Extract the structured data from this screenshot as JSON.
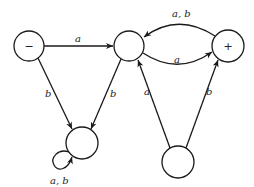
{
  "diagram": {
    "type": "finite-automaton",
    "nodes": [
      {
        "id": "start",
        "label": "−",
        "cx": 29,
        "cy": 46,
        "r": 15
      },
      {
        "id": "mid",
        "label": "",
        "cx": 129,
        "cy": 46,
        "r": 15
      },
      {
        "id": "final",
        "label": "+",
        "cx": 228,
        "cy": 46,
        "r": 16
      },
      {
        "id": "sink",
        "label": "",
        "cx": 82,
        "cy": 143,
        "r": 16
      },
      {
        "id": "bottom",
        "label": "",
        "cx": 178,
        "cy": 162,
        "r": 16
      }
    ],
    "edges": [
      {
        "from": "start",
        "to": "mid",
        "label": "a"
      },
      {
        "from": "start",
        "to": "sink",
        "label": "b"
      },
      {
        "from": "mid",
        "to": "sink",
        "label": "b"
      },
      {
        "from": "mid",
        "to": "final",
        "label": "a"
      },
      {
        "from": "final",
        "to": "mid",
        "label": "a, b"
      },
      {
        "from": "bottom",
        "to": "mid",
        "label": "a"
      },
      {
        "from": "bottom",
        "to": "final",
        "label": "b"
      },
      {
        "from": "sink",
        "to": "sink",
        "label": "a, b"
      }
    ]
  }
}
